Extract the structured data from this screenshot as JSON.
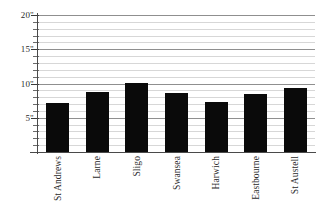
{
  "chart_data": {
    "type": "bar",
    "title": "",
    "subtitle": "",
    "xlabel": "",
    "ylabel": "",
    "categories": [
      "St Andrews",
      "Larne",
      "Sligo",
      "Swansea",
      "Harwich",
      "Eastbourne",
      "St Austell"
    ],
    "values": [
      7.2,
      8.8,
      10.1,
      8.6,
      7.3,
      8.5,
      9.4
    ],
    "unit": "\"",
    "ylim": [
      0,
      20
    ],
    "ytick_values": [
      5,
      10,
      15,
      20
    ],
    "ytick_labels": [
      "5\"",
      "10\"",
      "15\"",
      "20\""
    ],
    "minor_tick_step": 1,
    "grid": true,
    "grid_minor": true,
    "legend": "none",
    "bar_color": "#0a0a0a",
    "gridline_color": "#d7d7d7",
    "major_gridline_color": "#8f8f8f",
    "axis_color": "#4a4a4a"
  }
}
